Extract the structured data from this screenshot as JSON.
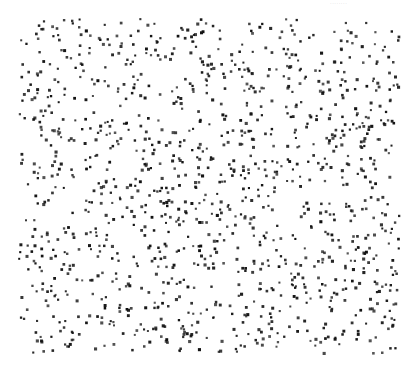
{
  "header": {
    "text": "········"
  },
  "stimulus": {
    "type": "random-dot-pattern",
    "bounds": {
      "x_min": 18,
      "x_max": 398,
      "y_min": 18,
      "y_max": 352
    },
    "dot_count": 1270,
    "dot_size_px": 2.6,
    "dot_color": "#111111",
    "background": "#ffffff",
    "seed": 7341
  }
}
